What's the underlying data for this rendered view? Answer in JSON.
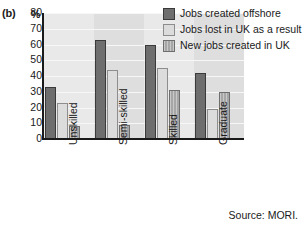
{
  "panel": {
    "label": "(b)",
    "unit": "%"
  },
  "chart_data": {
    "type": "bar",
    "title": "",
    "subtitle": "",
    "xlabel": "",
    "ylabel": "%",
    "ylim": [
      0,
      80
    ],
    "ytick_step": 10,
    "yticks": [
      "80",
      "70",
      "60",
      "50",
      "40",
      "30",
      "20",
      "10",
      "0"
    ],
    "grid": true,
    "legend_position": "top-right-inside",
    "categories": [
      "Unskilled",
      "Semi-skilled",
      "Skilled",
      "Graduate"
    ],
    "series": [
      {
        "name": "Jobs created offshore",
        "color": "#6e6e6e",
        "values": [
          33,
          63,
          60,
          42
        ]
      },
      {
        "name": "Jobs lost in UK as a result",
        "color": "#dcdcdc",
        "values": [
          23,
          44,
          45,
          19
        ]
      },
      {
        "name": "New jobs created in UK",
        "color": "#a6a6a6",
        "values": [
          8,
          9,
          31,
          30
        ]
      }
    ],
    "annotations": [
      "Source: MORI."
    ]
  },
  "source_note": "Source: MORI."
}
